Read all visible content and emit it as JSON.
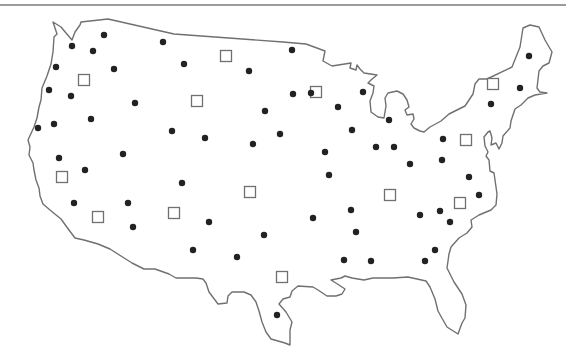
{
  "map": {
    "width": 566,
    "height": 359,
    "colors": {
      "background": "#ffffff",
      "outline": "#707070",
      "top_rule": "#7a7a7a",
      "dot": "#222222",
      "square_stroke": "#707070",
      "square_fill": "#ffffff"
    },
    "top_rule": {
      "x1": 0,
      "y1": 5,
      "x2": 566,
      "y2": 5
    },
    "outline_path": "M80,25 L81,22 L108,19 L174,34 L283,42 L306,44 L325,51 L323,61 L332,66 L351,63 L350,68 L356,70 L357,65 L360,69 L364,73 L377,75 L371,80 L368,83 L374,86 L373,93 L370,101 L371,112 L378,117 L384,118 L386,106 L385,98 L388,93 L397,91 L403,94 L407,100 L409,107 L405,110 L407,115 L413,114 L414,119 L411,124 L414,128 L420,131 L424,132 L430,127 L441,121 L449,114 L465,106 L473,94 L475,84 L479,79 L487,79 L512,67 L520,47 L523,28 L530,25 L539,27 L545,40 L552,52 L549,63 L543,66 L539,71 L537,88 L540,92 L547,93 L535,95 L528,98 L521,105 L515,109 L511,121 L510,128 L503,136 L502,143 L499,149 L496,143 L491,145 L492,138 L490,131 L488,132 L484,137 L485,146 L488,152 L486,156 L489,160 L490,171 L494,173 L495,180 L497,194 L496,205 L491,210 L479,215 L471,220 L472,227 L467,233 L459,238 L451,247 L449,254 L447,268 L454,282 L462,294 L466,305 L465,318 L462,323 L458,334 L447,327 L443,320 L438,311 L435,299 L430,287 L426,281 L408,277 L393,278 L373,278 L364,280 L352,278 L345,276 L341,278 L331,280 L339,285 L345,289 L342,294 L336,296 L327,296 L318,290 L313,287 L298,286 L292,291 L290,297 L283,299 L279,304 L286,312 L292,322 L290,330 L290,345 L285,343 L271,339 L266,332 L262,322 L259,311 L256,302 L251,295 L244,292 L232,292 L228,296 L227,303 L218,304 L215,300 L209,292 L206,283 L203,279 L196,278 L176,278 L169,274 L155,269 L144,269 L132,263 L121,256 L110,249 L98,244 L84,240 L75,238 L69,230 L61,219 L50,210 L43,204 L40,196 L39,188 L36,180 L34,170 L33,163 L29,155 L30,147 L28,140 L34,127 L37,118 L39,107 L41,100 L42,88 L47,76 L51,64 L53,52 L54,37 L57,34 L53,22 L61,27 L66,33 L72,40 L75,32 Z",
    "dots_label": "filled-circle markers",
    "squares_label": "open-square markers",
    "dot_radius": 3.2,
    "square_size": 11,
    "dots": [
      [
        104,
        35
      ],
      [
        163,
        42
      ],
      [
        72,
        46
      ],
      [
        93,
        51
      ],
      [
        114,
        69
      ],
      [
        56,
        67
      ],
      [
        184,
        64
      ],
      [
        249,
        71
      ],
      [
        292,
        50
      ],
      [
        49,
        90
      ],
      [
        71,
        96
      ],
      [
        135,
        103
      ],
      [
        293,
        94
      ],
      [
        311,
        93
      ],
      [
        363,
        92
      ],
      [
        338,
        107
      ],
      [
        265,
        111
      ],
      [
        38,
        128
      ],
      [
        54,
        124
      ],
      [
        91,
        119
      ],
      [
        172,
        131
      ],
      [
        205,
        138
      ],
      [
        253,
        144
      ],
      [
        280,
        134
      ],
      [
        352,
        130
      ],
      [
        389,
        120
      ],
      [
        376,
        147
      ],
      [
        394,
        147
      ],
      [
        325,
        152
      ],
      [
        123,
        154
      ],
      [
        59,
        158
      ],
      [
        85,
        170
      ],
      [
        182,
        183
      ],
      [
        329,
        175
      ],
      [
        410,
        164
      ],
      [
        443,
        139
      ],
      [
        442,
        160
      ],
      [
        469,
        177
      ],
      [
        479,
        195
      ],
      [
        74,
        203
      ],
      [
        128,
        203
      ],
      [
        133,
        227
      ],
      [
        209,
        222
      ],
      [
        264,
        235
      ],
      [
        313,
        218
      ],
      [
        351,
        210
      ],
      [
        420,
        215
      ],
      [
        440,
        211
      ],
      [
        450,
        222
      ],
      [
        193,
        250
      ],
      [
        237,
        257
      ],
      [
        356,
        232
      ],
      [
        344,
        260
      ],
      [
        371,
        261
      ],
      [
        425,
        261
      ],
      [
        435,
        250
      ],
      [
        277,
        315
      ],
      [
        529,
        56
      ],
      [
        520,
        88
      ],
      [
        491,
        104
      ]
    ],
    "squares": [
      [
        84,
        80
      ],
      [
        197,
        101
      ],
      [
        226,
        56
      ],
      [
        316,
        92
      ],
      [
        62,
        177
      ],
      [
        98,
        217
      ],
      [
        174,
        213
      ],
      [
        250,
        192
      ],
      [
        390,
        195
      ],
      [
        460,
        203
      ],
      [
        466,
        140
      ],
      [
        493,
        84
      ],
      [
        282,
        277
      ]
    ]
  }
}
